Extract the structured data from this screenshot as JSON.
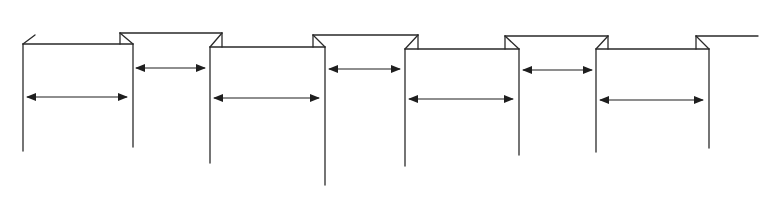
{
  "diagram": {
    "title": "",
    "colors": {
      "stroke": "#2a2a2a",
      "background": "#ffffff"
    },
    "panels": [
      {
        "id": "panel-1",
        "left_x": 23,
        "right_x": 133,
        "top_y": 44,
        "left_bottom": 151,
        "right_bottom": 147,
        "arrow_y": 97
      },
      {
        "id": "panel-2",
        "left_x": 210,
        "right_x": 325,
        "top_y": 47,
        "left_bottom": 163,
        "right_bottom": 185,
        "arrow_y": 98
      },
      {
        "id": "panel-3",
        "left_x": 405,
        "right_x": 519,
        "top_y": 49,
        "left_bottom": 166,
        "right_bottom": 155,
        "arrow_y": 99
      },
      {
        "id": "panel-4",
        "left_x": 596,
        "right_x": 709,
        "top_y": 49,
        "left_bottom": 152,
        "right_bottom": 148,
        "arrow_y": 100
      }
    ],
    "gaps": [
      {
        "id": "gap-1",
        "left_x": 120,
        "right_x": 222,
        "top_y": 33,
        "arrow_from": 136,
        "arrow_to": 205,
        "arrow_y": 68
      },
      {
        "id": "gap-2",
        "left_x": 313,
        "right_x": 418,
        "top_y": 35,
        "arrow_from": 329,
        "arrow_to": 400,
        "arrow_y": 69
      },
      {
        "id": "gap-3",
        "left_x": 505,
        "right_x": 608,
        "top_y": 36,
        "arrow_from": 523,
        "arrow_to": 592,
        "arrow_y": 70
      }
    ],
    "left_stub": {
      "x1": 23,
      "y1": 44,
      "x2": 35,
      "y2": 35
    },
    "right_tail": {
      "left_x": 696,
      "right_x": 758,
      "top_y": 36
    }
  }
}
